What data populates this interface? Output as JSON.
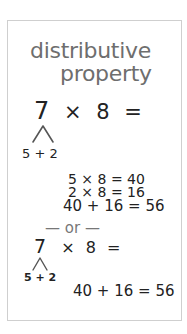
{
  "card": {
    "title_line1": "distributive",
    "title_line2": "property",
    "example1": {
      "left_operand": "7",
      "operator": "×",
      "right_operand": "8",
      "equals": "=",
      "split": "5 + 2",
      "steps": [
        "5 × 8 = 40",
        "2 × 8 = 16",
        "40 + 16 = 56"
      ]
    },
    "separator": "— or —",
    "example2": {
      "left_operand": "7",
      "operator": "×",
      "right_operand": "8",
      "equals": "=",
      "split": "5 + 2",
      "result": "40 + 16 = 56"
    }
  },
  "colors": {
    "title": "#6e6e6e",
    "ink": "#222222",
    "border": "#cfcfcf",
    "separator": "#777777"
  }
}
